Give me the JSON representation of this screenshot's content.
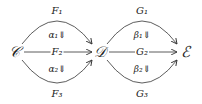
{
  "diagram": {
    "objects": [
      {
        "id": "C",
        "label": "𝒞",
        "x": 14,
        "y": 52
      },
      {
        "id": "D",
        "label": "𝒟",
        "x": 100,
        "y": 52
      },
      {
        "id": "E",
        "label": "ℰ",
        "x": 185,
        "y": 52
      }
    ],
    "morphisms": [
      {
        "id": "F1",
        "label": "F₁",
        "from": "C",
        "to": "D",
        "shape": "arc-up",
        "lx": 57,
        "ly": 11
      },
      {
        "id": "F2",
        "label": "F₂",
        "from": "C",
        "to": "D",
        "shape": "straight",
        "lx": 57,
        "ly": 52
      },
      {
        "id": "F3",
        "label": "F₃",
        "from": "C",
        "to": "D",
        "shape": "arc-down",
        "lx": 57,
        "ly": 94
      },
      {
        "id": "G1",
        "label": "G₁",
        "from": "D",
        "to": "E",
        "shape": "arc-up",
        "lx": 142,
        "ly": 11
      },
      {
        "id": "G2",
        "label": "G₂",
        "from": "D",
        "to": "E",
        "shape": "straight",
        "lx": 142,
        "ly": 52
      },
      {
        "id": "G3",
        "label": "G₃",
        "from": "D",
        "to": "E",
        "shape": "arc-down",
        "lx": 142,
        "ly": 94
      }
    ],
    "two_cells": [
      {
        "id": "alpha1",
        "label": "α₁⇓",
        "from": "F1",
        "to": "F2",
        "x": 57,
        "y": 35
      },
      {
        "id": "alpha2",
        "label": "α₂⇓",
        "from": "F2",
        "to": "F3",
        "x": 57,
        "y": 69
      },
      {
        "id": "beta1",
        "label": "β₁⇓",
        "from": "G1",
        "to": "G2",
        "x": 142,
        "y": 35
      },
      {
        "id": "beta2",
        "label": "β₂⇓",
        "from": "G2",
        "to": "G3",
        "x": 142,
        "y": 69
      }
    ],
    "colors": {
      "stroke": "#333333",
      "text": "#222222"
    }
  }
}
